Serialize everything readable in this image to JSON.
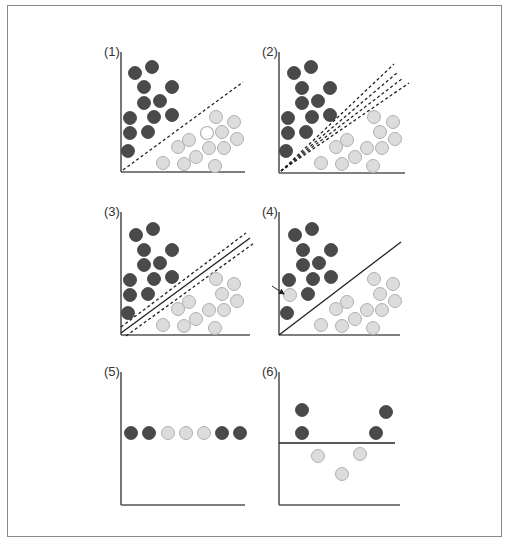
{
  "figure": {
    "colors": {
      "frame": "#8a8a8a",
      "axis": "#555555",
      "dark_fill": "#4a4a4a",
      "dark_stroke": "#3a3a3a",
      "light_fill": "#dcdcdc",
      "light_stroke": "#b0b0b0",
      "white_fill": "#ffffff",
      "line": "#222222"
    },
    "dot_radius": 6.5,
    "panels": [
      {
        "label": "(1)",
        "label_pos": [
          104,
          56
        ],
        "axis": {
          "x": 121,
          "top": 52,
          "bottom": 172,
          "right": 245
        },
        "dark": [
          [
            135,
            73
          ],
          [
            152,
            67
          ],
          [
            144,
            87
          ],
          [
            172,
            87
          ],
          [
            144,
            103
          ],
          [
            160,
            101
          ],
          [
            130,
            118
          ],
          [
            154,
            117
          ],
          [
            172,
            115
          ],
          [
            130,
            133
          ],
          [
            148,
            132
          ],
          [
            128,
            151
          ]
        ],
        "light": [
          [
            216,
            117
          ],
          [
            234,
            122
          ],
          [
            222,
            132
          ],
          [
            237,
            139
          ],
          [
            189,
            140
          ],
          [
            178,
            147
          ],
          [
            209,
            148
          ],
          [
            224,
            148
          ],
          [
            196,
            157
          ],
          [
            163,
            163
          ],
          [
            184,
            164
          ],
          [
            215,
            166
          ]
        ],
        "white": [
          [
            207,
            133
          ]
        ],
        "lines": [
          {
            "x1": 123,
            "y1": 170,
            "x2": 243,
            "y2": 82,
            "style": "dashed"
          }
        ]
      },
      {
        "label": "(2)",
        "label_pos": [
          262,
          56
        ],
        "axis": {
          "x": 279,
          "top": 52,
          "bottom": 173,
          "right": 405
        },
        "dark": [
          [
            294,
            73
          ],
          [
            311,
            67
          ],
          [
            302,
            88
          ],
          [
            330,
            88
          ],
          [
            302,
            103
          ],
          [
            318,
            101
          ],
          [
            288,
            118
          ],
          [
            312,
            117
          ],
          [
            330,
            115
          ],
          [
            288,
            133
          ],
          [
            306,
            132
          ],
          [
            286,
            151
          ]
        ],
        "light": [
          [
            374,
            117
          ],
          [
            393,
            122
          ],
          [
            380,
            132
          ],
          [
            395,
            139
          ],
          [
            347,
            140
          ],
          [
            336,
            147
          ],
          [
            367,
            148
          ],
          [
            382,
            148
          ],
          [
            355,
            157
          ],
          [
            321,
            163
          ],
          [
            342,
            164
          ],
          [
            373,
            166
          ]
        ],
        "white": [],
        "lines": [
          {
            "x1": 281,
            "y1": 171,
            "x2": 394,
            "y2": 64,
            "style": "dashed"
          },
          {
            "x1": 281,
            "y1": 171,
            "x2": 398,
            "y2": 72,
            "style": "dashed"
          },
          {
            "x1": 281,
            "y1": 171,
            "x2": 403,
            "y2": 78,
            "style": "dashed"
          },
          {
            "x1": 281,
            "y1": 171,
            "x2": 409,
            "y2": 83,
            "style": "dashed"
          }
        ]
      },
      {
        "label": "(3)",
        "label_pos": [
          104,
          216
        ],
        "axis": {
          "x": 121,
          "top": 212,
          "bottom": 335,
          "right": 250
        },
        "dark": [
          [
            136,
            235
          ],
          [
            153,
            229
          ],
          [
            144,
            250
          ],
          [
            172,
            250
          ],
          [
            144,
            265
          ],
          [
            160,
            263
          ],
          [
            130,
            280
          ],
          [
            154,
            279
          ],
          [
            172,
            277
          ],
          [
            130,
            295
          ],
          [
            148,
            294
          ],
          [
            128,
            313
          ]
        ],
        "light": [
          [
            216,
            279
          ],
          [
            234,
            284
          ],
          [
            222,
            294
          ],
          [
            237,
            301
          ],
          [
            189,
            302
          ],
          [
            178,
            309
          ],
          [
            209,
            310
          ],
          [
            224,
            310
          ],
          [
            196,
            319
          ],
          [
            163,
            325
          ],
          [
            184,
            326
          ],
          [
            215,
            328
          ]
        ],
        "white": [],
        "lines": [
          {
            "x1": 121,
            "y1": 333,
            "x2": 250,
            "y2": 238,
            "style": "solid"
          },
          {
            "x1": 121,
            "y1": 327,
            "x2": 246,
            "y2": 233,
            "style": "dashed"
          },
          {
            "x1": 126,
            "y1": 336,
            "x2": 254,
            "y2": 243,
            "style": "dashed"
          }
        ]
      },
      {
        "label": "(4)",
        "label_pos": [
          262,
          216
        ],
        "axis": {
          "x": 279,
          "top": 212,
          "bottom": 335,
          "right": 400
        },
        "dark": [
          [
            295,
            235
          ],
          [
            312,
            229
          ],
          [
            303,
            250
          ],
          [
            331,
            250
          ],
          [
            303,
            265
          ],
          [
            319,
            263
          ],
          [
            289,
            280
          ],
          [
            313,
            279
          ],
          [
            331,
            277
          ],
          [
            308,
            294
          ],
          [
            287,
            313
          ]
        ],
        "light": [
          [
            290,
            295
          ],
          [
            374,
            279
          ],
          [
            393,
            284
          ],
          [
            380,
            294
          ],
          [
            395,
            301
          ],
          [
            347,
            302
          ],
          [
            336,
            309
          ],
          [
            367,
            310
          ],
          [
            382,
            310
          ],
          [
            355,
            319
          ],
          [
            321,
            325
          ],
          [
            342,
            326
          ],
          [
            373,
            328
          ]
        ],
        "white": [],
        "lines": [
          {
            "x1": 279,
            "y1": 335,
            "x2": 401,
            "y2": 242,
            "style": "solid"
          }
        ],
        "arrow": {
          "x1": 272,
          "y1": 286,
          "x2": 284,
          "y2": 294,
          "label": "outlier"
        }
      },
      {
        "label": "(5)",
        "label_pos": [
          104,
          376
        ],
        "axis": {
          "x": 121,
          "top": 372,
          "bottom": 505,
          "right": 245
        },
        "dark": [
          [
            131,
            433
          ],
          [
            149,
            433
          ],
          [
            222,
            433
          ],
          [
            240,
            433
          ]
        ],
        "light": [
          [
            168,
            433
          ],
          [
            186,
            433
          ],
          [
            204,
            433
          ]
        ],
        "white": [],
        "lines": []
      },
      {
        "label": "(6)",
        "label_pos": [
          262,
          376
        ],
        "axis": {
          "x": 279,
          "top": 372,
          "bottom": 505,
          "right": 400
        },
        "dark": [
          [
            302,
            410
          ],
          [
            302,
            433
          ],
          [
            386,
            412
          ],
          [
            376,
            433
          ]
        ],
        "light": [
          [
            318,
            456
          ],
          [
            360,
            454
          ],
          [
            342,
            474
          ]
        ],
        "white": [],
        "lines": [
          {
            "x1": 279,
            "y1": 443,
            "x2": 395,
            "y2": 443,
            "style": "solid"
          }
        ]
      }
    ]
  }
}
